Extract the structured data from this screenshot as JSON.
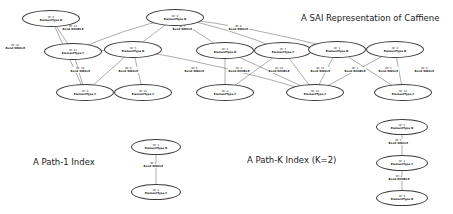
{
  "captions": {
    "main": "A SAI Representation of Caffiene",
    "path1": "A Path-1 Index",
    "pathk": "A Path-K Index (K=2)"
  },
  "labels": {
    "id_prefix": "ID: ",
    "element_prefix": "ElementType ",
    "bond_prefix": "Bond "
  },
  "main_graph": {
    "nodes": [
      {
        "id": "ID: 6",
        "type": "ElementType N",
        "x": 22,
        "y": 10,
        "w": 58,
        "h": 17
      },
      {
        "id": "ID: 4",
        "type": "ElementType N",
        "x": 146,
        "y": 9,
        "w": 58,
        "h": 17
      },
      {
        "id": "ID: 11",
        "type": "ElementType C",
        "x": 44,
        "y": 43,
        "w": 58,
        "h": 17
      },
      {
        "id": "ID: 5",
        "type": "ElementType N",
        "x": 104,
        "y": 41,
        "w": 58,
        "h": 17
      },
      {
        "id": "ID: 3",
        "type": "ElementType N",
        "x": 196,
        "y": 42,
        "w": 58,
        "h": 17
      },
      {
        "id": "ID: 7",
        "type": "ElementType C",
        "x": 254,
        "y": 42,
        "w": 58,
        "h": 17
      },
      {
        "id": "ID: 1",
        "type": "ElementType N",
        "x": 308,
        "y": 41,
        "w": 58,
        "h": 17
      },
      {
        "id": "ID: 8",
        "type": "ElementType N",
        "x": 366,
        "y": 41,
        "w": 58,
        "h": 17
      },
      {
        "id": "ID: 9",
        "type": "ElementType C",
        "x": 56,
        "y": 84,
        "w": 58,
        "h": 17
      },
      {
        "id": "ID: 12",
        "type": "ElementType C",
        "x": 114,
        "y": 84,
        "w": 58,
        "h": 17
      },
      {
        "id": "ID: 2",
        "type": "ElementType C",
        "x": 196,
        "y": 84,
        "w": 58,
        "h": 17
      },
      {
        "id": "ID: 13",
        "type": "ElementType C",
        "x": 286,
        "y": 84,
        "w": 58,
        "h": 17
      },
      {
        "id": "ID: 14",
        "type": "ElementType C",
        "x": 374,
        "y": 84,
        "w": 58,
        "h": 17
      }
    ],
    "edge_labels": [
      {
        "id": "ID: 11",
        "bond": "Bond SINGLE",
        "x": 5,
        "y": 44
      },
      {
        "id": "ID: 13",
        "bond": "Bond DOUBLE",
        "x": 62,
        "y": 25
      },
      {
        "id": "ID: 7",
        "bond": "Bond SINGLE",
        "x": 172,
        "y": 25
      },
      {
        "id": "ID: 8",
        "bond": "Bond SINGLE",
        "x": 228,
        "y": 25
      },
      {
        "id": "ID: 10",
        "bond": "Bond SINGLE",
        "x": 70,
        "y": 67
      },
      {
        "id": "ID: 9",
        "bond": "Bond SINGLE",
        "x": 118,
        "y": 67
      },
      {
        "id": "ID: 6",
        "bond": "Bond SINGLE",
        "x": 184,
        "y": 67
      },
      {
        "id": "ID: 2",
        "bond": "Bond DOUBLE",
        "x": 228,
        "y": 67
      },
      {
        "id": "ID: 14",
        "bond": "Bond DOUBLE",
        "x": 268,
        "y": 67
      },
      {
        "id": "ID: 15",
        "bond": "Bond SINGLE",
        "x": 310,
        "y": 67
      },
      {
        "id": "ID: 1",
        "bond": "Bond DOUBLE",
        "x": 344,
        "y": 67
      },
      {
        "id": "ID: 5",
        "bond": "Bond SINGLE",
        "x": 378,
        "y": 67
      },
      {
        "id": "ID: 3",
        "bond": "Bond SINGLE",
        "x": 414,
        "y": 67
      }
    ],
    "edges": [
      {
        "from": "ID: 6",
        "to": "ID: 11"
      },
      {
        "from": "ID: 6",
        "to": "ID: 9"
      },
      {
        "from": "ID: 11",
        "to": "ID: 9"
      },
      {
        "from": "ID: 11",
        "to": "ID: 5"
      },
      {
        "from": "ID: 5",
        "to": "ID: 9"
      },
      {
        "from": "ID: 5",
        "to": "ID: 12"
      },
      {
        "from": "ID: 5",
        "to": "ID: 13"
      },
      {
        "from": "ID: 4",
        "to": "ID: 11"
      },
      {
        "from": "ID: 4",
        "to": "ID: 5"
      },
      {
        "from": "ID: 4",
        "to": "ID: 3"
      },
      {
        "from": "ID: 4",
        "to": "ID: 7"
      },
      {
        "from": "ID: 4",
        "to": "ID: 1"
      },
      {
        "from": "ID: 3",
        "to": "ID: 2"
      },
      {
        "from": "ID: 3",
        "to": "ID: 13"
      },
      {
        "from": "ID: 7",
        "to": "ID: 2"
      },
      {
        "from": "ID: 7",
        "to": "ID: 13"
      },
      {
        "from": "ID: 1",
        "to": "ID: 13"
      },
      {
        "from": "ID: 1",
        "to": "ID: 14"
      },
      {
        "from": "ID: 8",
        "to": "ID: 13"
      },
      {
        "from": "ID: 8",
        "to": "ID: 14"
      }
    ]
  },
  "path1_index": {
    "nodes": [
      {
        "id": "ID: 1",
        "type": "ElementType N",
        "x": 131,
        "y": 139,
        "w": 50,
        "h": 16
      },
      {
        "id": "ID: 2",
        "type": "ElementType C",
        "x": 131,
        "y": 184,
        "w": 50,
        "h": 16
      }
    ],
    "edge_labels": [
      {
        "id": "ID: 1",
        "bond": "Bond SINGLE",
        "x": 143,
        "y": 162
      }
    ],
    "edges": [
      {
        "from": "ID: 1",
        "to": "ID: 2"
      }
    ]
  },
  "pathk_index": {
    "nodes": [
      {
        "id": "ID: 1",
        "type": "ElementType N",
        "x": 376,
        "y": 119,
        "w": 52,
        "h": 16
      },
      {
        "id": "ID: 2",
        "type": "ElementType C",
        "x": 376,
        "y": 155,
        "w": 52,
        "h": 16
      },
      {
        "id": "ID: 3",
        "type": "ElementType N",
        "x": 376,
        "y": 190,
        "w": 52,
        "h": 16
      }
    ],
    "edge_labels": [
      {
        "id": "ID: 1",
        "bond": "Bond SINGLE",
        "x": 388,
        "y": 139
      },
      {
        "id": "ID: 2",
        "bond": "Bond DOUBLE",
        "x": 388,
        "y": 175
      }
    ],
    "edges": [
      {
        "from": "ID: 1",
        "to": "ID: 2"
      },
      {
        "from": "ID: 2",
        "to": "ID: 3"
      }
    ]
  },
  "style": {
    "node_stroke": "#3a3a3a",
    "edge_stroke": "#5a5a5a",
    "text_color": "#1a1a1a",
    "background": "#ffffff"
  }
}
